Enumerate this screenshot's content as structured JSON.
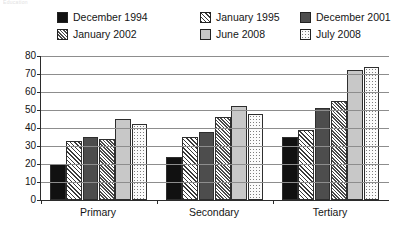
{
  "top_remnant_text": "Education",
  "legend": {
    "items": [
      {
        "label": "December 1994",
        "pattern": "solid-black",
        "color": "#111111"
      },
      {
        "label": "January 1995",
        "pattern": "diag-light",
        "color": "#3a3a3a"
      },
      {
        "label": "December 2001",
        "pattern": "solid-dark",
        "color": "#4d4d4d"
      },
      {
        "label": "January 2002",
        "pattern": "diag-dense",
        "color": "#4a4a4a"
      },
      {
        "label": "June 2008",
        "pattern": "solid-light",
        "color": "#c8c8c8"
      },
      {
        "label": "July 2008",
        "pattern": "dots",
        "color": "#7d7d7d"
      }
    ]
  },
  "chart_data": {
    "type": "bar",
    "title": "",
    "xlabel": "",
    "ylabel": "",
    "ylim": [
      0,
      80
    ],
    "yticks": [
      0,
      10,
      20,
      30,
      40,
      50,
      60,
      70,
      80
    ],
    "ytick_labels": [
      "0",
      "10",
      "20",
      "30",
      "40",
      "50",
      "60",
      "70",
      "80"
    ],
    "grid": true,
    "legend_position": "top",
    "categories": [
      "Primary",
      "Secondary",
      "Tertiary"
    ],
    "series": [
      {
        "name": "December 1994",
        "values": [
          20,
          24,
          35
        ]
      },
      {
        "name": "January 1995",
        "values": [
          33,
          35,
          39
        ]
      },
      {
        "name": "December 2001",
        "values": [
          35,
          38,
          51
        ]
      },
      {
        "name": "January 2002",
        "values": [
          34,
          46,
          55
        ]
      },
      {
        "name": "June 2008",
        "values": [
          45,
          52,
          72
        ]
      },
      {
        "name": "July 2008",
        "values": [
          42,
          48,
          74
        ]
      }
    ]
  }
}
